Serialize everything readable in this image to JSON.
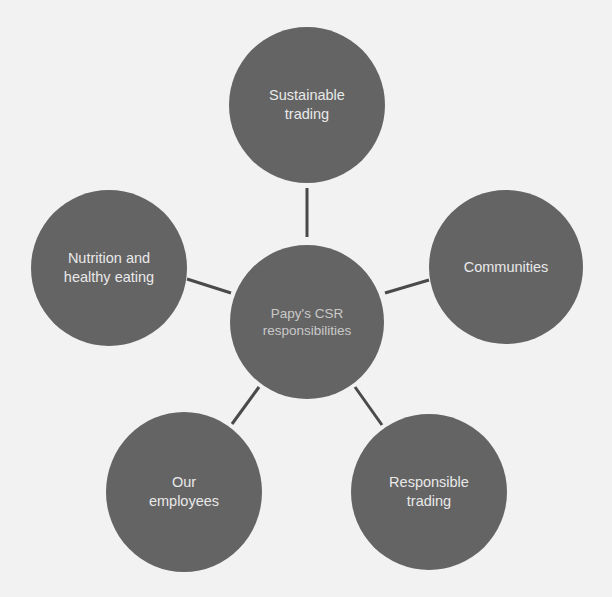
{
  "diagram": {
    "type": "hub-and-spoke",
    "colors": {
      "background": "#f2f2f2",
      "node_fill": "#646464",
      "connector": "#4a4a4a",
      "label_text": "#e9e9e9",
      "center_label_text": "#c9c9c9"
    },
    "center": {
      "label": "Papy's CSR responsibilities",
      "line1": "Papy's CSR",
      "line2": "responsibilities"
    },
    "nodes": [
      {
        "id": "sustainable-trading",
        "line1": "Sustainable",
        "line2": "trading"
      },
      {
        "id": "communities",
        "line1": "Communities",
        "line2": ""
      },
      {
        "id": "responsible-trading",
        "line1": "Responsible",
        "line2": "trading"
      },
      {
        "id": "our-employees",
        "line1": "Our",
        "line2": "employees"
      },
      {
        "id": "nutrition",
        "line1": "Nutrition and",
        "line2": "healthy eating"
      }
    ]
  }
}
